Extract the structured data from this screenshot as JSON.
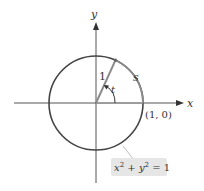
{
  "diagram": {
    "axes": {
      "x_label": "x",
      "y_label": "y"
    },
    "circle": {
      "equation_lhs_x": "x",
      "equation_lhs_y": "y",
      "exponent": "2",
      "equation_rhs": "= 1",
      "plus": "+"
    },
    "radius_label": "1",
    "angle_label": "t",
    "arc_label": "s",
    "point_label": "(1, 0)",
    "colors": {
      "circle": "#444444",
      "axes": "#555555",
      "arc": "#8a8a8a",
      "radius": "#8a8a8a",
      "label_box": "#e6e6e6"
    }
  }
}
